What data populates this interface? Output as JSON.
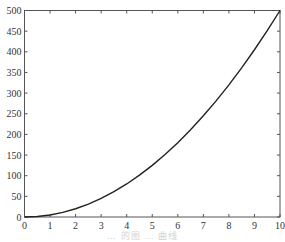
{
  "chart_data": {
    "type": "line",
    "title": "",
    "xlabel": "",
    "ylabel": "",
    "xlim": [
      0,
      10
    ],
    "ylim": [
      0,
      500
    ],
    "grid": false,
    "legend": null,
    "x_ticks": [
      "0",
      "1",
      "2",
      "3",
      "4",
      "5",
      "6",
      "7",
      "8",
      "9",
      "10"
    ],
    "y_ticks": [
      "0",
      "50",
      "100",
      "150",
      "200",
      "250",
      "300",
      "350",
      "400",
      "450",
      "500"
    ],
    "series": [
      {
        "name": "y = 5x^2",
        "color": "#222222",
        "x": [
          0,
          0.5,
          1,
          1.5,
          2,
          2.5,
          3,
          3.5,
          4,
          4.5,
          5,
          5.5,
          6,
          6.5,
          7,
          7.5,
          8,
          8.5,
          9,
          9.5,
          10
        ],
        "y": [
          0,
          1.25,
          5,
          11.25,
          20,
          31.25,
          45,
          61.25,
          80,
          101.25,
          125,
          151.25,
          180,
          211.25,
          245,
          281.25,
          320,
          361.25,
          405,
          451.25,
          500
        ]
      }
    ],
    "caption": "… 的图 … 曲线"
  },
  "plot": {
    "frame_color": "#555555",
    "line_color": "#222222"
  }
}
